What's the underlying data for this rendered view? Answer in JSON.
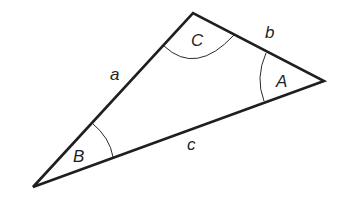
{
  "diagram": {
    "type": "triangle",
    "vertices": {
      "A": {
        "label": "A",
        "x": 324,
        "y": 81
      },
      "B": {
        "label": "B",
        "x": 33,
        "y": 187
      },
      "C": {
        "label": "C",
        "x": 193,
        "y": 13
      }
    },
    "sides": {
      "a": {
        "label": "a",
        "from": "B",
        "to": "C"
      },
      "b": {
        "label": "b",
        "from": "C",
        "to": "A"
      },
      "c": {
        "label": "c",
        "from": "B",
        "to": "A"
      }
    },
    "angle_labels": [
      "A",
      "B",
      "C"
    ],
    "side_labels": [
      "a",
      "b",
      "c"
    ],
    "colors": {
      "stroke": "#1f1f1f",
      "background": "#ffffff"
    }
  }
}
